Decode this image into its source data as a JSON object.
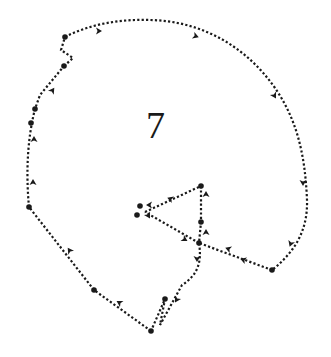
{
  "figure": {
    "label": "7",
    "colors": {
      "line": "#1a1a1a",
      "background": "#ffffff"
    },
    "path": {
      "segments": [
        {
          "id": "arc",
          "d": "M65,37 C90,24 120,19 150,20 C200,21 245,45 275,88 C295,117 305,150 307,200 C308,230 295,252 272,270"
        },
        {
          "id": "right-return",
          "d": "M272,270 L199,243"
        },
        {
          "id": "junction-to-center",
          "d": "M199,243 L145,212"
        },
        {
          "id": "center-to-apex",
          "d": "M145,212 L201,186"
        },
        {
          "id": "apex-vertical",
          "d": "M201,186 L201,222 L199,243"
        },
        {
          "id": "descent",
          "d": "M199,243 C202,262 198,275 182,285 L160,325 L165,299 L151,331"
        },
        {
          "id": "bottom-left",
          "d": "M151,331 L94,290 L29,207"
        },
        {
          "id": "left-side",
          "d": "M29,207 C26,175 27,140 35,109 L40,95 L64,66"
        },
        {
          "id": "zigzag",
          "d": "M64,66 L73,58 L61,50 L65,37"
        }
      ],
      "nodes": [
        {
          "x": 65,
          "y": 37
        },
        {
          "x": 64,
          "y": 66
        },
        {
          "x": 35,
          "y": 109
        },
        {
          "x": 31,
          "y": 123
        },
        {
          "x": 29,
          "y": 207
        },
        {
          "x": 94,
          "y": 290
        },
        {
          "x": 151,
          "y": 331
        },
        {
          "x": 165,
          "y": 299
        },
        {
          "x": 201,
          "y": 186
        },
        {
          "x": 201,
          "y": 222
        },
        {
          "x": 199,
          "y": 243
        },
        {
          "x": 272,
          "y": 270
        },
        {
          "x": 140,
          "y": 206
        },
        {
          "x": 137,
          "y": 215
        }
      ],
      "arrows": [
        {
          "x": 98,
          "y": 31,
          "angle": 0
        },
        {
          "x": 195,
          "y": 36,
          "angle": 20
        },
        {
          "x": 274,
          "y": 95,
          "angle": 60
        },
        {
          "x": 303,
          "y": 182,
          "angle": 90
        },
        {
          "x": 291,
          "y": 243,
          "angle": 110
        },
        {
          "x": 244,
          "y": 260,
          "angle": 200
        },
        {
          "x": 229,
          "y": 249,
          "angle": 200
        },
        {
          "x": 206,
          "y": 195,
          "angle": -90
        },
        {
          "x": 206,
          "y": 233,
          "angle": -90
        },
        {
          "x": 171,
          "y": 199,
          "angle": 200
        },
        {
          "x": 150,
          "y": 205,
          "angle": 180
        },
        {
          "x": 184,
          "y": 239,
          "angle": 30
        },
        {
          "x": 197,
          "y": 258,
          "angle": 90
        },
        {
          "x": 177,
          "y": 299,
          "angle": 120
        },
        {
          "x": 120,
          "y": 303,
          "angle": 210
        },
        {
          "x": 70,
          "y": 251,
          "angle": 235
        },
        {
          "x": 33,
          "y": 183,
          "angle": -90
        },
        {
          "x": 34,
          "y": 140,
          "angle": -90
        },
        {
          "x": 52,
          "y": 91,
          "angle": -55
        },
        {
          "x": 148,
          "y": 215,
          "angle": 60
        }
      ]
    }
  }
}
